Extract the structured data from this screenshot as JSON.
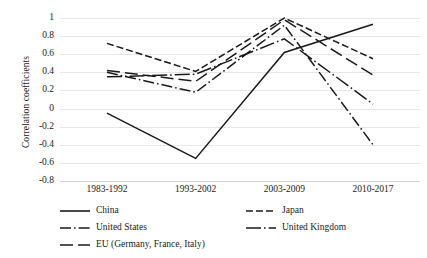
{
  "chart_data": {
    "type": "line",
    "title": "",
    "xlabel": "",
    "ylabel": "Correlation coefficients",
    "categories": [
      "1983-1992",
      "1993-2002",
      "2003-2009",
      "2010-2017"
    ],
    "ylim": [
      -0.8,
      1.0
    ],
    "ytick_labels": [
      "1",
      "0.8",
      "0.6",
      "0.4",
      "0.2",
      "0",
      "-0.2",
      "-0.4",
      "-0.6",
      "-0.8"
    ],
    "ytick_values": [
      1,
      0.8,
      0.6,
      0.4,
      0.2,
      0,
      -0.2,
      -0.4,
      -0.6,
      -0.8
    ],
    "grid": true,
    "legend_position": "bottom",
    "series": [
      {
        "name": "China",
        "values": [
          -0.05,
          -0.55,
          0.62,
          0.93
        ],
        "style": "solid",
        "color": "#1a1a1a"
      },
      {
        "name": "Japan",
        "values": [
          0.72,
          0.41,
          1.0,
          0.55
        ],
        "style": "dashed",
        "color": "#1a1a1a"
      },
      {
        "name": "United States",
        "values": [
          0.4,
          0.18,
          0.92,
          -0.4
        ],
        "style": "dash-dot",
        "color": "#1a1a1a"
      },
      {
        "name": "United Kingdom",
        "values": [
          0.35,
          0.38,
          0.77,
          0.05
        ],
        "style": "long-dash-dot",
        "color": "#1a1a1a"
      },
      {
        "name": "EU (Germany, France, Italy)",
        "values": [
          0.42,
          0.3,
          0.98,
          0.37
        ],
        "style": "long-dash",
        "color": "#1a1a1a"
      }
    ]
  },
  "axis": {
    "y_title": "Correlation coefficients"
  },
  "colors": {
    "line": "#1a1a1a",
    "gridline": "#e6e6e6",
    "axis": "#d0d0d0",
    "background": "#ffffff"
  }
}
